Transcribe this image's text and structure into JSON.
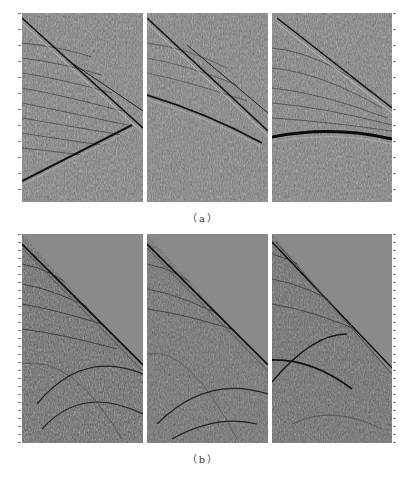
{
  "figure": {
    "subfigures": [
      {
        "id": "a",
        "caption": "（a）",
        "panels": [
          {
            "index": 1,
            "description": "seismic gather with crossing linear events and upward-dipping event"
          },
          {
            "index": 2,
            "description": "seismic gather with two parallel dipping linear events"
          },
          {
            "index": 3,
            "description": "seismic gather with dipping linear event and strong curved horizontal reflection"
          }
        ]
      },
      {
        "id": "b",
        "caption": "（b）",
        "panels": [
          {
            "index": 1,
            "description": "shot gather with muted upper-right triangle and first-break diagonal"
          },
          {
            "index": 2,
            "description": "shot gather with muted upper-right triangle and first-break diagonal"
          },
          {
            "index": 3,
            "description": "shot gather with muted upper-right triangle, first-break diagonal and crossing hyperbolic events"
          }
        ]
      }
    ],
    "colors": {
      "background": "#ffffff",
      "panel_gray": "#7f7f7f",
      "mute_gray": "#8a8a8a",
      "event_dark": "#1a1a1a",
      "caption_text": "#333333"
    }
  }
}
